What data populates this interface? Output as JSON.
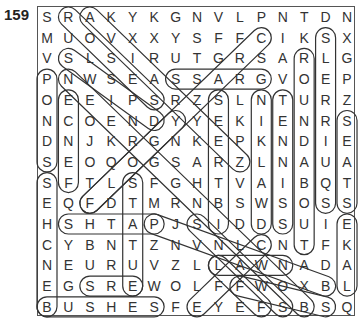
{
  "puzzle": {
    "number": "159",
    "grid": [
      "SRAKYKGNVLPNTDN",
      "MUOVXXYSFFCIKSX",
      "VSLSIRUTGRSARLG",
      "PNWSEASSARGVOEP",
      "OEEIPSRZSLNTURZ",
      "NCOENDYYEKIENRS",
      "DNJKRGNKEPKNDIE",
      "SEOQOGSARZLNAUA",
      "SFTLSFGHTVAIBQT",
      "EQFDTMRNBSWSOSS",
      "HSHTAPJSIDDSUIE",
      "CYBNTZNVNLCNTFK",
      "NEURUVZLLAWNADA",
      "EGSREWOLFFWOXBL",
      "BUSHESFEYEFSBSQ"
    ],
    "found_words": [
      {
        "from": [
          3,
          0
        ],
        "to": [
          7,
          0
        ]
      },
      {
        "from": [
          8,
          0
        ],
        "to": [
          14,
          0
        ]
      },
      {
        "from": [
          4,
          1
        ],
        "to": [
          8,
          1
        ]
      },
      {
        "from": [
          14,
          0
        ],
        "to": [
          14,
          5
        ]
      },
      {
        "from": [
          10,
          1
        ],
        "to": [
          10,
          5
        ]
      },
      {
        "from": [
          13,
          2
        ],
        "to": [
          13,
          4
        ]
      },
      {
        "from": [
          8,
          4
        ],
        "to": [
          13,
          4
        ]
      },
      {
        "from": [
          9,
          2
        ],
        "to": [
          5,
          6
        ]
      },
      {
        "from": [
          3,
          6
        ],
        "to": [
          3,
          10
        ]
      },
      {
        "from": [
          4,
          8
        ],
        "to": [
          10,
          8
        ]
      },
      {
        "from": [
          4,
          10
        ],
        "to": [
          10,
          10
        ]
      },
      {
        "from": [
          4,
          11
        ],
        "to": [
          10,
          11
        ]
      },
      {
        "from": [
          2,
          12
        ],
        "to": [
          11,
          12
        ]
      },
      {
        "from": [
          1,
          13
        ],
        "to": [
          9,
          13
        ]
      },
      {
        "from": [
          5,
          14
        ],
        "to": [
          9,
          14
        ]
      },
      {
        "from": [
          10,
          14
        ],
        "to": [
          13,
          14
        ]
      },
      {
        "from": [
          12,
          8
        ],
        "to": [
          12,
          11
        ]
      },
      {
        "from": [
          0,
          1
        ],
        "to": [
          4,
          5
        ]
      },
      {
        "from": [
          0,
          2
        ],
        "to": [
          7,
          9
        ]
      },
      {
        "from": [
          2,
          1
        ],
        "to": [
          5,
          5
        ]
      },
      {
        "from": [
          3,
          1
        ],
        "to": [
          14,
          12
        ]
      },
      {
        "from": [
          1,
          10
        ],
        "to": [
          9,
          2
        ]
      },
      {
        "from": [
          10,
          7
        ],
        "to": [
          14,
          11
        ]
      },
      {
        "from": [
          11,
          10
        ],
        "to": [
          14,
          7
        ]
      },
      {
        "from": [
          12,
          8
        ],
        "to": [
          14,
          10
        ]
      },
      {
        "from": [
          13,
          9
        ],
        "to": [
          14,
          13
        ]
      },
      {
        "from": [
          10,
          5
        ],
        "to": [
          13,
          13
        ]
      }
    ]
  }
}
